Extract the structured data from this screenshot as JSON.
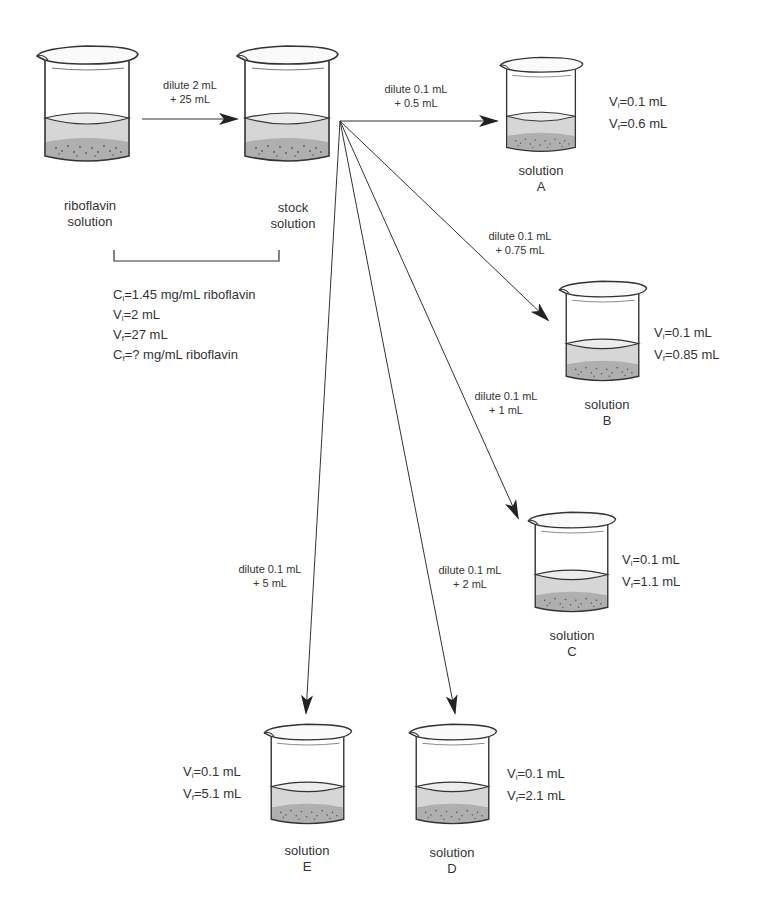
{
  "diagram": {
    "title_fragment": "",
    "source": {
      "label_line1": "riboflavin",
      "label_line2": "solution"
    },
    "stock": {
      "label_line1": "stock",
      "label_line2": "solution"
    },
    "first_dilution": {
      "line1": "dilute 2 mL",
      "line2": "+ 25 mL"
    },
    "given": {
      "ci_var": "C",
      "ci_sub": "i",
      "ci_val": "=1.45 mg/mL riboflavin",
      "vi_var": "V",
      "vi_sub": "i",
      "vi_val": "=2 mL",
      "vf_var": "V",
      "vf_sub": "f",
      "vf_val": "=27 mL",
      "cf_var": "C",
      "cf_sub": "f",
      "cf_val": "=? mg/mL riboflavin"
    },
    "solutions": [
      {
        "name": "A",
        "label": "solution",
        "letter": "A",
        "dilute_line1": "dilute 0.1 mL",
        "dilute_line2": "+ 0.5 mL",
        "vi": "=0.1 mL",
        "vf": "=0.6 mL"
      },
      {
        "name": "B",
        "label": "solution",
        "letter": "B",
        "dilute_line1": "dilute 0.1 mL",
        "dilute_line2": "+ 0.75 mL",
        "vi": "=0.1 mL",
        "vf": "=0.85 mL"
      },
      {
        "name": "C",
        "label": "solution",
        "letter": "C",
        "dilute_line1": "dilute 0.1 mL",
        "dilute_line2": "+ 1 mL",
        "vi": "=0.1 mL",
        "vf": "=1.1 mL"
      },
      {
        "name": "D",
        "label": "solution",
        "letter": "D",
        "dilute_line1": "dilute 0.1 mL",
        "dilute_line2": "+ 2 mL",
        "vi": "=0.1 mL",
        "vf": "=2.1 mL"
      },
      {
        "name": "E",
        "label": "solution",
        "letter": "E",
        "dilute_line1": "dilute 0.1 mL",
        "dilute_line2": "+ 5 mL",
        "vi": "=0.1 mL",
        "vf": "=5.1 mL"
      }
    ],
    "vol_labels": {
      "v": "V",
      "i": "i",
      "f": "f"
    },
    "colors": {
      "line": "#333333",
      "liquid": "#d8d8d8",
      "sediment": "#9a9a9a",
      "glass": "#444444"
    }
  }
}
